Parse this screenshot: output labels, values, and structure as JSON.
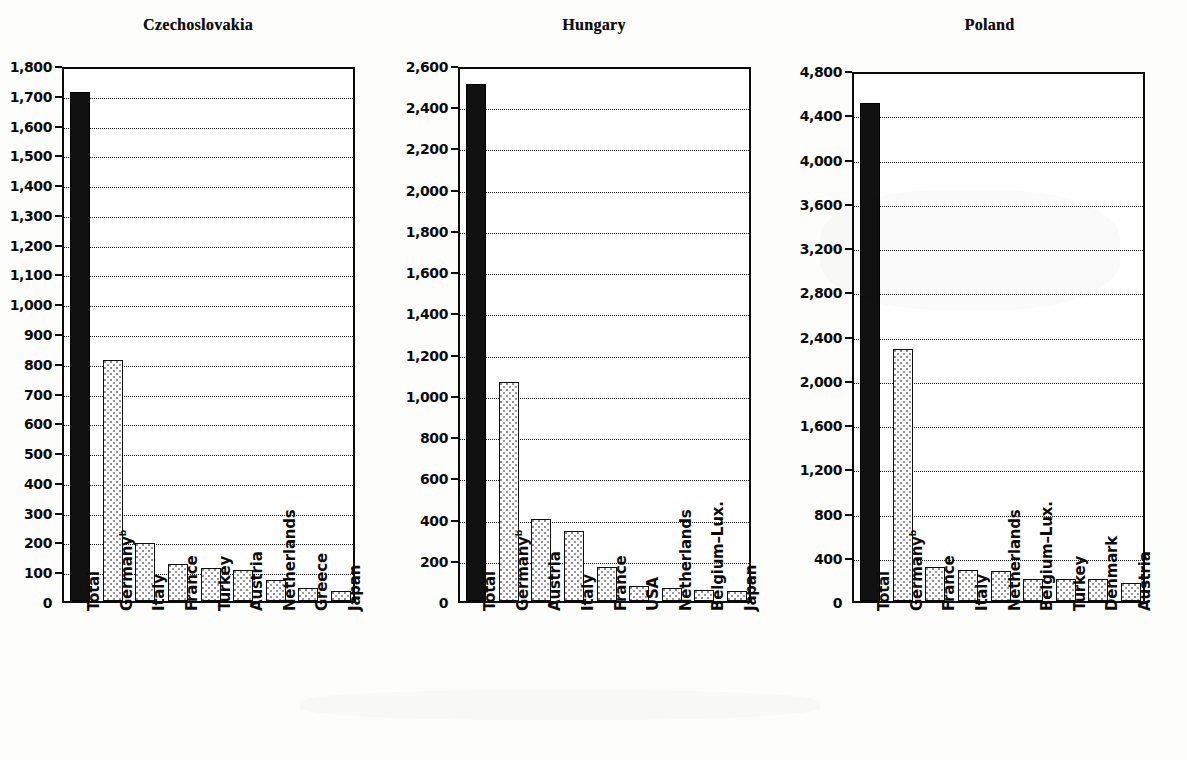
{
  "page": {
    "background_color": "#fdfdfc",
    "ink_color": "#0b0b0b",
    "footnote_marker": "b"
  },
  "chart_data": [
    {
      "type": "bar",
      "title": "Czechoslovakia",
      "xlabel": "",
      "ylabel": "",
      "ylim": [
        0,
        1800
      ],
      "ytick_step": 100,
      "grid": true,
      "legend": "none",
      "categories": [
        "Total",
        "Germany b",
        "Italy",
        "France",
        "Turkey",
        "Austria",
        "Netherlands",
        "Greece",
        "Japan"
      ],
      "values": [
        1710,
        810,
        195,
        125,
        110,
        103,
        70,
        45,
        35
      ],
      "bar_styles": [
        "solid",
        "dotted",
        "dotted",
        "dotted",
        "dotted",
        "dotted",
        "dotted",
        "dotted",
        "dotted"
      ],
      "tick_labels": [
        "1,800",
        "1,700",
        "1,600",
        "1,500",
        "1,400",
        "1,300",
        "1,200",
        "1,100",
        "1,000",
        "900",
        "800",
        "700",
        "600",
        "500",
        "400",
        "300",
        "200",
        "100",
        "0"
      ],
      "tick_values": [
        1800,
        1700,
        1600,
        1500,
        1400,
        1300,
        1200,
        1100,
        1000,
        900,
        800,
        700,
        600,
        500,
        400,
        300,
        200,
        100,
        0
      ]
    },
    {
      "type": "bar",
      "title": "Hungary",
      "xlabel": "",
      "ylabel": "",
      "ylim": [
        0,
        2600
      ],
      "ytick_step": 200,
      "grid": true,
      "legend": "none",
      "categories": [
        "Total",
        "Germany b",
        "Austria",
        "Italy",
        "France",
        "USA",
        "Netherlands",
        "Belgium–Lux.",
        "Japan"
      ],
      "values": [
        2510,
        1060,
        400,
        340,
        165,
        75,
        65,
        55,
        50
      ],
      "bar_styles": [
        "solid",
        "dotted",
        "dotted",
        "dotted",
        "dotted",
        "dotted",
        "dotted",
        "dotted",
        "dotted"
      ],
      "tick_labels": [
        "2,600",
        "2,400",
        "2,200",
        "2,000",
        "1,800",
        "1,600",
        "1,400",
        "1,200",
        "1,000",
        "800",
        "600",
        "400",
        "200",
        "0"
      ],
      "tick_values": [
        2600,
        2400,
        2200,
        2000,
        1800,
        1600,
        1400,
        1200,
        1000,
        800,
        600,
        400,
        200,
        0
      ]
    },
    {
      "type": "bar",
      "title": "Poland",
      "xlabel": "",
      "ylabel": "",
      "ylim": [
        0,
        4800
      ],
      "ytick_step": 400,
      "grid": true,
      "legend": "none",
      "categories": [
        "Total",
        "Germany b",
        "France",
        "Italy",
        "Netherlands",
        "Belgium–Lux.",
        "Turkey",
        "Denmark",
        "Austria"
      ],
      "values": [
        4500,
        2280,
        305,
        280,
        275,
        200,
        195,
        195,
        165
      ],
      "bar_styles": [
        "solid",
        "dotted",
        "dotted",
        "dotted",
        "dotted",
        "dotted",
        "dotted",
        "dotted",
        "dotted"
      ],
      "tick_labels": [
        "4,800",
        "4,400",
        "4,000",
        "3,600",
        "3,200",
        "2,800",
        "2,400",
        "2,000",
        "1,600",
        "1,200",
        "800",
        "400",
        "0"
      ],
      "tick_values": [
        4800,
        4400,
        4000,
        3600,
        3200,
        2800,
        2400,
        2000,
        1600,
        1200,
        800,
        400,
        0
      ]
    }
  ]
}
